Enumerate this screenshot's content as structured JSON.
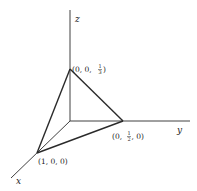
{
  "diagram": {
    "type": "3d-coordinate-plane-intercepts",
    "axes": {
      "x_label": "x",
      "y_label": "y",
      "z_label": "z"
    },
    "vertices": [
      {
        "id": "x-intercept",
        "coords": [
          1,
          0,
          0
        ],
        "label_parts": [
          "(1, 0, 0)"
        ]
      },
      {
        "id": "y-intercept",
        "coords": [
          0,
          0.5,
          0
        ],
        "label_parts": [
          "(0, ",
          "1",
          "2",
          ", 0)"
        ]
      },
      {
        "id": "z-intercept",
        "coords": [
          0,
          0,
          0.3333
        ],
        "label_parts": [
          "(0, 0, ",
          "1",
          "3",
          ")"
        ]
      }
    ],
    "labels": {
      "x_vertex": "(1, 0, 0)",
      "y_vertex_prefix": "(0, ",
      "y_vertex_num": "1",
      "y_vertex_den": "2",
      "y_vertex_suffix": ", 0)",
      "z_vertex_prefix": "(0, 0, ",
      "z_vertex_num": "1",
      "z_vertex_den": "3",
      "z_vertex_suffix": ")"
    }
  }
}
